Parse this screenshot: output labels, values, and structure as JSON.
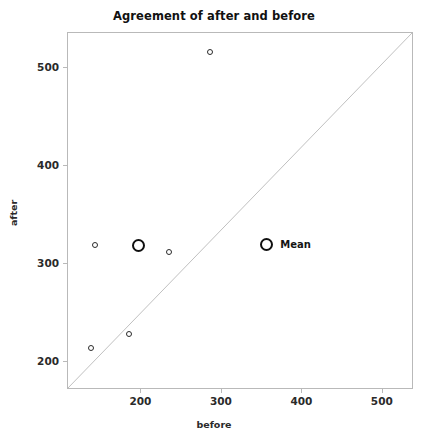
{
  "chart_data": {
    "type": "scatter",
    "title": "Agreement of after and before",
    "xlabel": "before",
    "ylabel": "after",
    "xlim": [
      110,
      540
    ],
    "ylim": [
      170,
      535
    ],
    "xticks": [
      200,
      300,
      400,
      500
    ],
    "yticks": [
      200,
      300,
      400,
      500
    ],
    "xtick_labels": [
      "200",
      "300",
      "400",
      "500"
    ],
    "ytick_labels": [
      "200",
      "300",
      "400",
      "500"
    ],
    "grid": false,
    "legend_position": "inside-center-right",
    "series": [
      {
        "name": "Subjects",
        "marker": "open-circle-small",
        "color": "#2b2b2b",
        "points": [
          {
            "before": 143,
            "after": 318
          },
          {
            "before": 236,
            "after": 311
          },
          {
            "before": 287,
            "after": 516
          },
          {
            "before": 186,
            "after": 227
          },
          {
            "before": 138,
            "after": 213
          }
        ]
      },
      {
        "name": "Mean",
        "marker": "open-circle-large",
        "color": "#101010",
        "points": [
          {
            "before": 197,
            "after": 318
          }
        ]
      }
    ],
    "reference_line": {
      "name": "identity-line",
      "type": "line-of-equality",
      "from": {
        "before": 110,
        "after": 170
      },
      "to": {
        "before": 540,
        "after": 535
      },
      "color": "#c0c0c0"
    },
    "legend": [
      {
        "label": "Mean",
        "marker": "open-circle-large",
        "color": "#101010"
      }
    ]
  },
  "legend_anchor": {
    "x_value": 357,
    "y_value": 318
  }
}
